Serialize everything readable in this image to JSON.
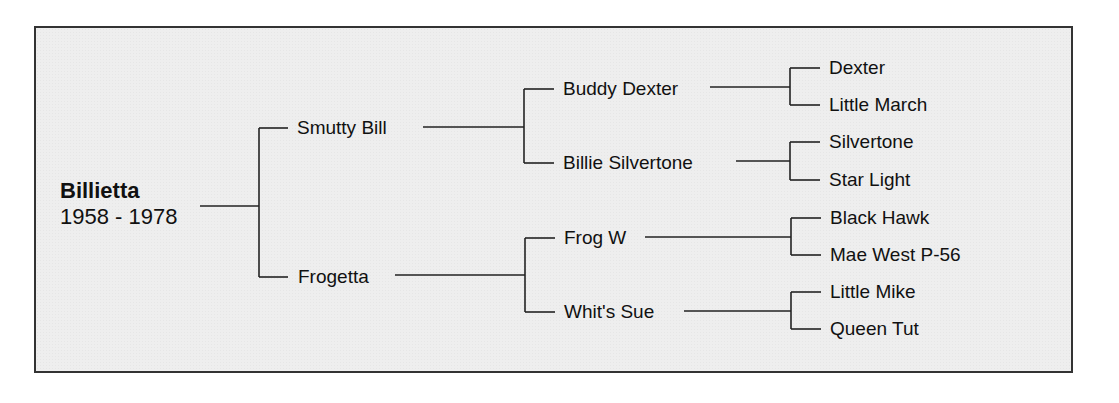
{
  "pedigree": {
    "subject": {
      "name": "Billietta",
      "dates": "1958 - 1978"
    },
    "sire": {
      "name": "Smutty Bill",
      "sire": {
        "name": "Buddy Dexter",
        "sire": "Dexter",
        "dam": "Little March"
      },
      "dam": {
        "name": "Billie Silvertone",
        "sire": "Silvertone",
        "dam": "Star Light"
      }
    },
    "dam": {
      "name": "Frogetta",
      "sire": {
        "name": "Frog W",
        "sire": "Black Hawk",
        "dam": "Mae West P-56"
      },
      "dam": {
        "name": "Whit's Sue",
        "sire": "Little Mike",
        "dam": "Queen Tut"
      }
    }
  },
  "colors": {
    "background": "#eeeeee",
    "border": "#333333",
    "line": "#222222",
    "text": "#111111"
  }
}
